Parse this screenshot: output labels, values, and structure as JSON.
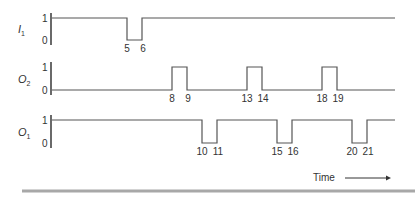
{
  "diagram": {
    "type": "timing-diagram",
    "time_axis_label": "Time",
    "level_labels": {
      "high": "1",
      "low": "0"
    },
    "signals": [
      {
        "id": "I1",
        "name": "I",
        "subscript": "1",
        "idle_level": 1,
        "pulses": [
          {
            "level": 0,
            "start": 5,
            "end": 6,
            "start_label": "5",
            "end_label": "6"
          }
        ]
      },
      {
        "id": "O2",
        "name": "O",
        "subscript": "2",
        "idle_level": 0,
        "pulses": [
          {
            "level": 1,
            "start": 8,
            "end": 9,
            "start_label": "8",
            "end_label": "9"
          },
          {
            "level": 1,
            "start": 13,
            "end": 14,
            "start_label": "13",
            "end_label": "14"
          },
          {
            "level": 1,
            "start": 18,
            "end": 19,
            "start_label": "18",
            "end_label": "19"
          }
        ]
      },
      {
        "id": "O1",
        "name": "O",
        "subscript": "1",
        "idle_level": 1,
        "pulses": [
          {
            "level": 0,
            "start": 10,
            "end": 11,
            "start_label": "10",
            "end_label": "11"
          },
          {
            "level": 0,
            "start": 15,
            "end": 16,
            "start_label": "15",
            "end_label": "16"
          },
          {
            "level": 0,
            "start": 20,
            "end": 21,
            "start_label": "20",
            "end_label": "21"
          }
        ]
      }
    ],
    "colors": {
      "wave": "#555555",
      "axis": "#444444",
      "text": "#333333",
      "rule": "#a8a8a8"
    }
  }
}
